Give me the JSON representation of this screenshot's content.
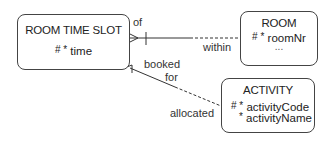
{
  "entities": {
    "room_time_slot": {
      "name": "ROOM TIME SLOT",
      "attributes": [
        {
          "markers": "# *",
          "name": "time"
        }
      ]
    },
    "room": {
      "name": "ROOM",
      "attributes": [
        {
          "markers": "# *",
          "name": "roomNr"
        }
      ],
      "ellipsis": "..."
    },
    "activity": {
      "name": "ACTIVITY",
      "attributes": [
        {
          "markers": "# *",
          "name": "activityCode"
        },
        {
          "markers": "*",
          "name": "activityName"
        }
      ]
    }
  },
  "relationships": [
    {
      "from": "ROOM TIME SLOT",
      "to": "ROOM",
      "from_label": "of",
      "to_label": "within",
      "from_card": "many",
      "from_optional": false,
      "to_optional": true
    },
    {
      "from": "ROOM TIME SLOT",
      "to": "ACTIVITY",
      "from_label": "booked for",
      "to_label": "allocated",
      "from_card": "many",
      "from_optional": false,
      "to_optional": true
    }
  ],
  "labels": {
    "of": "of",
    "within": "within",
    "booked": "booked",
    "for": "for",
    "allocated": "allocated"
  }
}
